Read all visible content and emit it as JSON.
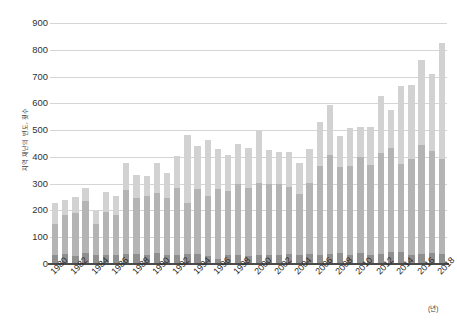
{
  "chart_data": {
    "type": "bar",
    "stacked": true,
    "title": "",
    "subtitle": "",
    "xlabel": "(년)",
    "ylabel": "지역 재난의 빈도, 횟수",
    "ylim": [
      0,
      900
    ],
    "ytick_values": [
      0,
      100,
      200,
      300,
      400,
      500,
      600,
      700,
      800,
      900
    ],
    "ytick_labels": [
      "0",
      "100",
      "200",
      "300",
      "400",
      "500",
      "600",
      "700",
      "800",
      "900"
    ],
    "grid": true,
    "legend": "none",
    "x": [
      1980,
      1981,
      1982,
      1983,
      1984,
      1985,
      1986,
      1987,
      1988,
      1989,
      1990,
      1991,
      1992,
      1993,
      1994,
      1995,
      1996,
      1997,
      1998,
      1999,
      2000,
      2001,
      2002,
      2003,
      2004,
      2005,
      2006,
      2007,
      2008,
      2009,
      2010,
      2011,
      2012,
      2013,
      2014,
      2015,
      2016,
      2017,
      2018
    ],
    "xtick_labels": [
      "1980",
      "1982",
      "1984",
      "1986",
      "1988",
      "1990",
      "1992",
      "1994",
      "1996",
      "1998",
      "2000",
      "2002",
      "2004",
      "2006",
      "2008",
      "2010",
      "2012",
      "2014",
      "2016",
      "2018"
    ],
    "series": [
      {
        "name": "low",
        "color": "#8f8f8f",
        "values": [
          35,
          38,
          30,
          42,
          33,
          35,
          33,
          37,
          36,
          32,
          40,
          35,
          35,
          38,
          37,
          30,
          20,
          33,
          35,
          30,
          32,
          33,
          35,
          36,
          33,
          37,
          35,
          38,
          42,
          35,
          40,
          33,
          38,
          44,
          45,
          33,
          36,
          43,
          36
        ]
      },
      {
        "name": "mid",
        "color": "#b4b4b4",
        "values": [
          115,
          145,
          162,
          192,
          117,
          160,
          150,
          240,
          210,
          222,
          225,
          210,
          250,
          190,
          245,
          225,
          260,
          240,
          265,
          255,
          270,
          265,
          265,
          250,
          230,
          265,
          330,
          370,
          320,
          330,
          360,
          335,
          375,
          390,
          330,
          360,
          410,
          380,
          355
        ]
      },
      {
        "name": "high",
        "color": "#d2d2d2",
        "values": [
          78,
          55,
          60,
          50,
          48,
          73,
          70,
          100,
          88,
          74,
          113,
          95,
          117,
          252,
          158,
          210,
          150,
          133,
          150,
          147,
          197,
          126,
          118,
          132,
          114,
          128,
          165,
          185,
          117,
          144,
          110,
          142,
          216,
          140,
          288,
          275,
          315,
          285,
          434
        ]
      }
    ],
    "totals": [
      228,
      238,
      252,
      284,
      198,
      268,
      253,
      377,
      334,
      328,
      378,
      340,
      402,
      480,
      440,
      465,
      430,
      406,
      450,
      432,
      499,
      424,
      418,
      418,
      377,
      430,
      530,
      593,
      479,
      509,
      510,
      510,
      629,
      574,
      663,
      668,
      761,
      708,
      825
    ]
  }
}
